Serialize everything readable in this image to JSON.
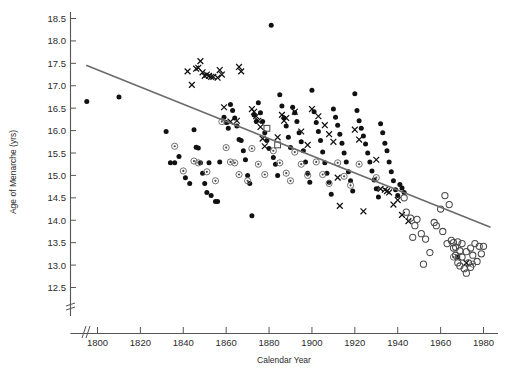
{
  "chart_data": {
    "type": "scatter",
    "title": "",
    "xlabel": "Calendar Year",
    "ylabel": "Age of Menarche (yrs)",
    "xlim": [
      1788,
      1990
    ],
    "ylim": [
      12.4,
      18.6
    ],
    "grid": false,
    "legend_position": "none",
    "xticks": [
      1800,
      1820,
      1840,
      1860,
      1880,
      1900,
      1920,
      1940,
      1960,
      1980
    ],
    "xtick_labels": [
      "1800",
      "1820",
      "1840",
      "1860",
      "1880",
      "1900",
      "1920",
      "1940",
      "1960",
      "1980"
    ],
    "yticks": [
      12.5,
      13.0,
      13.5,
      14.0,
      14.5,
      15.0,
      15.5,
      16.0,
      16.5,
      17.0,
      17.5,
      18.0,
      18.5
    ],
    "ytick_labels": [
      "12.5",
      "13.0",
      "13.5",
      "14.0",
      "14.5",
      "15.0",
      "15.5",
      "16.0",
      "16.5",
      "17.0",
      "17.5",
      "18.0",
      "18.5"
    ],
    "axis_breaks": {
      "x": true,
      "y": true
    },
    "trendline": {
      "label": "fitted regression line",
      "x_start": 1795,
      "y_start": 17.45,
      "x_end": 1983,
      "y_end": 13.85,
      "color": "#6b6b6b"
    },
    "series": [
      {
        "name": "filled-circle",
        "marker": "filled-circle",
        "color": "#111111",
        "points": [
          [
            1795,
            16.65
          ],
          [
            1810,
            16.75
          ],
          [
            1832,
            15.98
          ],
          [
            1834,
            15.28
          ],
          [
            1836,
            15.28
          ],
          [
            1838,
            15.42
          ],
          [
            1841,
            14.95
          ],
          [
            1843,
            14.82
          ],
          [
            1845,
            16.02
          ],
          [
            1846,
            15.63
          ],
          [
            1847,
            15.61
          ],
          [
            1848,
            15.28
          ],
          [
            1849,
            15.05
          ],
          [
            1850,
            14.82
          ],
          [
            1851,
            14.62
          ],
          [
            1852,
            15.28
          ],
          [
            1853,
            14.55
          ],
          [
            1855,
            14.42
          ],
          [
            1856,
            14.42
          ],
          [
            1857,
            15.3
          ],
          [
            1859,
            16.3
          ],
          [
            1860,
            16.18
          ],
          [
            1861,
            16.05
          ],
          [
            1862,
            16.58
          ],
          [
            1863,
            16.45
          ],
          [
            1864,
            16.28
          ],
          [
            1865,
            16.1
          ],
          [
            1866,
            15.8
          ],
          [
            1867,
            15.78
          ],
          [
            1868,
            15.55
          ],
          [
            1869,
            15.35
          ],
          [
            1870,
            15.0
          ],
          [
            1871,
            14.82
          ],
          [
            1872,
            14.1
          ],
          [
            1873,
            16.35
          ],
          [
            1874,
            16.2
          ],
          [
            1875,
            16.62
          ],
          [
            1876,
            16.4
          ],
          [
            1877,
            16.2
          ],
          [
            1878,
            15.95
          ],
          [
            1879,
            15.78
          ],
          [
            1880,
            15.6
          ],
          [
            1881,
            18.35
          ],
          [
            1882,
            15.4
          ],
          [
            1883,
            15.25
          ],
          [
            1884,
            15.0
          ],
          [
            1885,
            16.8
          ],
          [
            1886,
            16.55
          ],
          [
            1887,
            16.28
          ],
          [
            1888,
            16.1
          ],
          [
            1889,
            15.85
          ],
          [
            1890,
            15.62
          ],
          [
            1891,
            16.52
          ],
          [
            1892,
            16.4
          ],
          [
            1893,
            16.2
          ],
          [
            1894,
            15.95
          ],
          [
            1895,
            15.75
          ],
          [
            1896,
            15.55
          ],
          [
            1897,
            15.3
          ],
          [
            1898,
            15.05
          ],
          [
            1899,
            14.85
          ],
          [
            1900,
            16.9
          ],
          [
            1901,
            16.42
          ],
          [
            1902,
            16.18
          ],
          [
            1903,
            15.98
          ],
          [
            1904,
            15.78
          ],
          [
            1905,
            15.52
          ],
          [
            1906,
            15.28
          ],
          [
            1907,
            15.05
          ],
          [
            1908,
            14.85
          ],
          [
            1909,
            14.58
          ],
          [
            1910,
            16.48
          ],
          [
            1911,
            16.3
          ],
          [
            1912,
            16.12
          ],
          [
            1913,
            15.92
          ],
          [
            1914,
            15.72
          ],
          [
            1915,
            15.5
          ],
          [
            1916,
            15.3
          ],
          [
            1917,
            15.08
          ],
          [
            1918,
            14.88
          ],
          [
            1919,
            14.65
          ],
          [
            1920,
            16.82
          ],
          [
            1921,
            16.45
          ],
          [
            1922,
            16.22
          ],
          [
            1923,
            16.05
          ],
          [
            1924,
            15.88
          ],
          [
            1925,
            15.7
          ],
          [
            1926,
            15.5
          ],
          [
            1927,
            15.3
          ],
          [
            1928,
            15.1
          ],
          [
            1929,
            14.9
          ],
          [
            1930,
            14.7
          ],
          [
            1931,
            14.52
          ],
          [
            1932,
            16.15
          ],
          [
            1933,
            15.95
          ],
          [
            1934,
            15.72
          ],
          [
            1935,
            15.55
          ],
          [
            1936,
            15.3
          ],
          [
            1937,
            15.08
          ],
          [
            1938,
            14.88
          ],
          [
            1939,
            14.68
          ],
          [
            1940,
            14.55
          ],
          [
            1941,
            14.8
          ],
          [
            1942,
            14.72
          ],
          [
            1943,
            14.62
          ],
          [
            1968,
            13.18
          ]
        ]
      },
      {
        "name": "cross",
        "marker": "x",
        "color": "#111111",
        "points": [
          [
            1842,
            17.32
          ],
          [
            1844,
            17.02
          ],
          [
            1846,
            17.38
          ],
          [
            1847,
            17.4
          ],
          [
            1848,
            17.55
          ],
          [
            1849,
            17.3
          ],
          [
            1850,
            17.22
          ],
          [
            1851,
            17.25
          ],
          [
            1852,
            17.22
          ],
          [
            1853,
            17.2
          ],
          [
            1854,
            17.2
          ],
          [
            1856,
            17.18
          ],
          [
            1857,
            17.35
          ],
          [
            1858,
            17.25
          ],
          [
            1859,
            16.52
          ],
          [
            1862,
            16.2
          ],
          [
            1865,
            16.22
          ],
          [
            1866,
            17.42
          ],
          [
            1867,
            17.32
          ],
          [
            1872,
            16.48
          ],
          [
            1873,
            16.42
          ],
          [
            1874,
            16.32
          ],
          [
            1875,
            16.22
          ],
          [
            1876,
            16.08
          ],
          [
            1877,
            15.82
          ],
          [
            1878,
            15.65
          ],
          [
            1884,
            15.85
          ],
          [
            1886,
            16.35
          ],
          [
            1887,
            16.22
          ],
          [
            1888,
            16.28
          ],
          [
            1892,
            16.42
          ],
          [
            1895,
            15.98
          ],
          [
            1898,
            15.68
          ],
          [
            1900,
            16.48
          ],
          [
            1903,
            16.32
          ],
          [
            1906,
            16.12
          ],
          [
            1908,
            15.92
          ],
          [
            1910,
            15.75
          ],
          [
            1912,
            14.95
          ],
          [
            1913,
            14.32
          ],
          [
            1920,
            16.02
          ],
          [
            1922,
            15.8
          ],
          [
            1924,
            14.2
          ],
          [
            1930,
            15.35
          ],
          [
            1932,
            14.7
          ],
          [
            1934,
            14.68
          ],
          [
            1935,
            14.65
          ],
          [
            1936,
            14.62
          ],
          [
            1938,
            14.35
          ],
          [
            1940,
            14.45
          ],
          [
            1942,
            14.12
          ],
          [
            1945,
            13.98
          ],
          [
            1968,
            13.18
          ],
          [
            1972,
            13.05
          ]
        ]
      },
      {
        "name": "circle-with-dot",
        "marker": "circled-dot",
        "color": "#6a6a6a",
        "points": [
          [
            1836,
            15.65
          ],
          [
            1840,
            15.1
          ],
          [
            1845,
            15.32
          ],
          [
            1847,
            15.28
          ],
          [
            1851,
            15.08
          ],
          [
            1855,
            14.88
          ],
          [
            1858,
            16.2
          ],
          [
            1860,
            15.62
          ],
          [
            1862,
            15.3
          ],
          [
            1864,
            15.28
          ],
          [
            1866,
            15.02
          ],
          [
            1870,
            14.88
          ],
          [
            1872,
            15.6
          ],
          [
            1875,
            15.25
          ],
          [
            1878,
            15.02
          ],
          [
            1882,
            15.55
          ],
          [
            1885,
            15.28
          ],
          [
            1888,
            15.05
          ],
          [
            1890,
            14.88
          ],
          [
            1892,
            15.52
          ],
          [
            1895,
            15.25
          ],
          [
            1898,
            15.0
          ],
          [
            1902,
            15.3
          ],
          [
            1905,
            15.02
          ],
          [
            1908,
            14.82
          ],
          [
            1912,
            15.28
          ],
          [
            1915,
            14.98
          ],
          [
            1918,
            14.78
          ],
          [
            1922,
            15.25
          ],
          [
            1930,
            14.95
          ],
          [
            1966,
            13.18
          ],
          [
            1975,
            13.02
          ]
        ]
      },
      {
        "name": "open-square",
        "marker": "open-square",
        "color": "#4a4a4a",
        "points": [
          [
            1879,
            16.05
          ],
          [
            1884,
            15.68
          ]
        ]
      },
      {
        "name": "open-circle",
        "marker": "open-circle",
        "color": "#4a4a4a",
        "points": [
          [
            1943,
            14.5
          ],
          [
            1946,
            14.05
          ],
          [
            1948,
            13.88
          ],
          [
            1949,
            14.02
          ],
          [
            1951,
            13.7
          ],
          [
            1955,
            13.28
          ],
          [
            1957,
            13.95
          ],
          [
            1960,
            14.25
          ],
          [
            1961,
            13.75
          ],
          [
            1962,
            14.55
          ],
          [
            1963,
            13.48
          ],
          [
            1964,
            14.35
          ],
          [
            1965,
            13.55
          ],
          [
            1966,
            13.38
          ],
          [
            1966,
            13.5
          ],
          [
            1967,
            13.22
          ],
          [
            1967,
            13.4
          ],
          [
            1968,
            13.52
          ],
          [
            1968,
            13.05
          ],
          [
            1969,
            13.32
          ],
          [
            1969,
            12.98
          ],
          [
            1970,
            13.48
          ],
          [
            1970,
            13.18
          ],
          [
            1971,
            12.92
          ],
          [
            1972,
            13.3
          ],
          [
            1972,
            12.82
          ],
          [
            1973,
            13.05
          ],
          [
            1974,
            13.38
          ],
          [
            1974,
            12.95
          ],
          [
            1975,
            13.22
          ],
          [
            1976,
            13.48
          ],
          [
            1977,
            13.08
          ],
          [
            1978,
            13.42
          ],
          [
            1979,
            13.25
          ],
          [
            1952,
            13.02
          ],
          [
            1958,
            13.88
          ],
          [
            1944,
            14.18
          ],
          [
            1947,
            13.62
          ],
          [
            1953,
            13.58
          ],
          [
            1980,
            13.42
          ]
        ]
      }
    ]
  }
}
